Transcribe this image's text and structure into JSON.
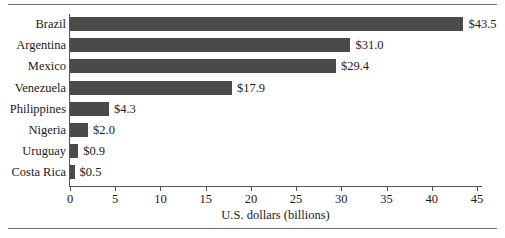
{
  "chart_data": {
    "type": "bar",
    "orientation": "horizontal",
    "title": "",
    "xlabel": "U.S. dollars (billions)",
    "ylabel": "",
    "xlim": [
      0,
      45
    ],
    "xticks": [
      0,
      5,
      10,
      15,
      20,
      25,
      30,
      35,
      40,
      45
    ],
    "xtick_labels": [
      "0",
      "5",
      "10",
      "15",
      "20",
      "25",
      "30",
      "35",
      "40",
      "45"
    ],
    "grid": false,
    "legend": null,
    "bar_color": "#4a4a4a",
    "categories": [
      "Brazil",
      "Argentina",
      "Mexico",
      "Venezuela",
      "Philippines",
      "Nigeria",
      "Uruguay",
      "Costa Rica"
    ],
    "values": [
      43.5,
      31.0,
      29.4,
      17.9,
      4.3,
      2.0,
      0.9,
      0.5
    ],
    "data_labels": [
      "$43.5",
      "$31.0",
      "$29.4",
      "$17.9",
      "$4.3",
      "$2.0",
      "$0.9",
      "$0.5"
    ]
  }
}
